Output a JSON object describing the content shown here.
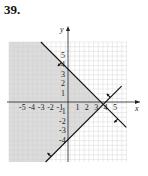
{
  "problem": {
    "number": "39."
  },
  "graph": {
    "x_axis_label": "x",
    "y_axis_label": "y",
    "x_ticks": [
      "-5",
      "-4",
      "-3",
      "-2",
      "-1",
      "1",
      "2",
      "3",
      "4",
      "5"
    ],
    "y_ticks": [
      "5",
      "4",
      "3",
      "2",
      "1",
      "-1",
      "-2",
      "-3",
      "-4"
    ],
    "colors": {
      "shade": "#dcdcdc",
      "grid": "#d0d0d0",
      "line": "#111111"
    },
    "lines": [
      {
        "name": "boundary-line-1",
        "equation": "x + y = 3.5",
        "x_intercept": 3.5,
        "y_intercept": 3.5,
        "arrow_direction": "toward-origin"
      },
      {
        "name": "boundary-line-2",
        "equation": "y = x - 4",
        "x_intercept": 4,
        "y_intercept": -4,
        "arrow_direction": "upper-left"
      }
    ],
    "shaded_region": "left of both lines"
  }
}
